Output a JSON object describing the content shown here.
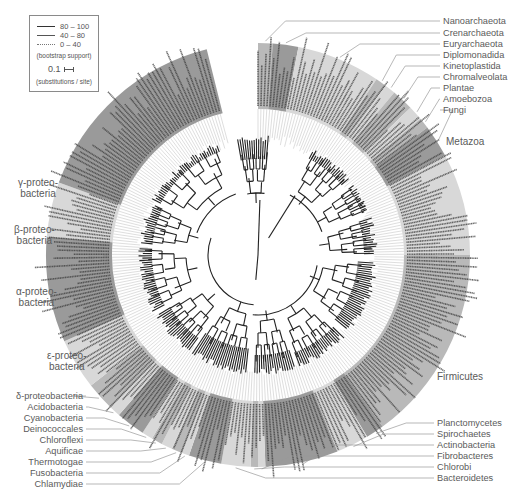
{
  "legend": {
    "support_entries": [
      {
        "style": "thick",
        "range": "80 – 100"
      },
      {
        "style": "medium",
        "range": "40 – 80"
      },
      {
        "style": "dotted",
        "range": "0 – 40"
      }
    ],
    "support_caption": "(bootstrap support)",
    "scale_value": "0.1",
    "scale_caption": "(substitutions / site)"
  },
  "colors": {
    "band_dark": "#9a9a9a",
    "band_mid": "#b9b9b9",
    "band_light": "#d8d8d8",
    "branch": "#222222",
    "leader_line": "#9a9a9a",
    "label_text": "#5a5a5a"
  },
  "labels_right_top": [
    {
      "text": "Nanoarchaeota",
      "x": 443,
      "y": 16
    },
    {
      "text": "Crenarchaeota",
      "x": 443,
      "y": 28
    },
    {
      "text": "Euryarchaeota",
      "x": 443,
      "y": 39
    },
    {
      "text": "Diplomonadida",
      "x": 443,
      "y": 50
    },
    {
      "text": "Kinetoplastida",
      "x": 443,
      "y": 61
    },
    {
      "text": "Chromalveolata",
      "x": 443,
      "y": 72
    },
    {
      "text": "Plantae",
      "x": 443,
      "y": 83
    },
    {
      "text": "Amoebozoa",
      "x": 443,
      "y": 94
    },
    {
      "text": "Fungi",
      "x": 443,
      "y": 105
    }
  ],
  "labels_right_mid": [
    {
      "text": "Metazoa",
      "x": 446,
      "y": 137
    },
    {
      "text": "Firmicutes",
      "x": 437,
      "y": 372
    }
  ],
  "labels_right_bottom": [
    {
      "text": "Planctomycetes",
      "x": 437,
      "y": 418
    },
    {
      "text": "Spirochaetes",
      "x": 437,
      "y": 429
    },
    {
      "text": "Actinobacteria",
      "x": 437,
      "y": 440
    },
    {
      "text": "Fibrobacteres",
      "x": 437,
      "y": 451
    },
    {
      "text": "Chlorobi",
      "x": 437,
      "y": 462
    },
    {
      "text": "Bacteroidetes",
      "x": 437,
      "y": 473
    }
  ],
  "labels_left_multi": [
    {
      "text": "γ-proteo-\nbacteria",
      "x": 18,
      "y": 177
    },
    {
      "text": "β-proteo-\nbacteria",
      "x": 14,
      "y": 224
    },
    {
      "text": "α-proteo-\nbacteria",
      "x": 16,
      "y": 286
    },
    {
      "text": "ε-proteo-\nbacteria",
      "x": 47,
      "y": 350
    }
  ],
  "labels_left_bottom": [
    {
      "text": "δ-proteobacteria",
      "right": 83,
      "y": 391
    },
    {
      "text": "Acidobacteria",
      "right": 83,
      "y": 402
    },
    {
      "text": "Cyanobacteria",
      "right": 83,
      "y": 413
    },
    {
      "text": "Deinococcales",
      "right": 83,
      "y": 424
    },
    {
      "text": "Chloroflexi",
      "right": 83,
      "y": 435
    },
    {
      "text": "Aquificae",
      "right": 83,
      "y": 446
    },
    {
      "text": "Thermotogae",
      "right": 83,
      "y": 457
    },
    {
      "text": "Fusobacteria",
      "right": 83,
      "y": 468
    },
    {
      "text": "Chlamydiae",
      "right": 83,
      "y": 479
    }
  ],
  "tree": {
    "center_x": 258,
    "center_y": 255,
    "inner_radius": 118,
    "outer_radius": 212,
    "gap_start_deg": -104,
    "gap_end_deg": -90,
    "clades": [
      {
        "name": "Nanoarchaeota",
        "start": -90,
        "end": -86,
        "shade": "mid"
      },
      {
        "name": "Crenarchaeota",
        "start": -86,
        "end": -79,
        "shade": "dark"
      },
      {
        "name": "Euryarchaeota",
        "start": -79,
        "end": -56,
        "shade": "light"
      },
      {
        "name": "Diplomonadida",
        "start": -56,
        "end": -53,
        "shade": "mid"
      },
      {
        "name": "Kinetoplastida",
        "start": -53,
        "end": -50,
        "shade": "light"
      },
      {
        "name": "Chromalveolata",
        "start": -50,
        "end": -44,
        "shade": "mid"
      },
      {
        "name": "Plantae",
        "start": -44,
        "end": -40,
        "shade": "light"
      },
      {
        "name": "Amoebozoa",
        "start": -40,
        "end": -37,
        "shade": "mid"
      },
      {
        "name": "Fungi",
        "start": -37,
        "end": -28,
        "shade": "dark"
      },
      {
        "name": "Metazoa",
        "start": -28,
        "end": 0,
        "shade": "light"
      },
      {
        "name": "Firmicutes",
        "start": 0,
        "end": 54,
        "shade": "mid"
      },
      {
        "name": "Planctomycetes",
        "start": 54,
        "end": 59,
        "shade": "dark"
      },
      {
        "name": "Spirochaetes",
        "start": 59,
        "end": 68,
        "shade": "light"
      },
      {
        "name": "Actinobacteria",
        "start": 68,
        "end": 88,
        "shade": "dark"
      },
      {
        "name": "Fibrobacteres",
        "start": 88,
        "end": 90,
        "shade": "light"
      },
      {
        "name": "Chlorobi",
        "start": 90,
        "end": 92,
        "shade": "mid"
      },
      {
        "name": "Bacteroidetes",
        "start": 92,
        "end": 100,
        "shade": "light"
      },
      {
        "name": "Chlamydiae",
        "start": 100,
        "end": 109,
        "shade": "dark"
      },
      {
        "name": "Fusobacteria",
        "start": 109,
        "end": 111,
        "shade": "light"
      },
      {
        "name": "Thermotogae",
        "start": 111,
        "end": 114,
        "shade": "mid"
      },
      {
        "name": "Aquificae",
        "start": 114,
        "end": 117,
        "shade": "light"
      },
      {
        "name": "Chloroflexi",
        "start": 117,
        "end": 120,
        "shade": "mid"
      },
      {
        "name": "Deinococcales",
        "start": 120,
        "end": 123,
        "shade": "light"
      },
      {
        "name": "Cyanobacteria",
        "start": 123,
        "end": 131,
        "shade": "dark"
      },
      {
        "name": "Acidobacteria",
        "start": 131,
        "end": 134,
        "shade": "light"
      },
      {
        "name": "δ-proteobacteria",
        "start": 134,
        "end": 142,
        "shade": "mid"
      },
      {
        "name": "ε-proteobacteria",
        "start": 142,
        "end": 156,
        "shade": "light"
      },
      {
        "name": "α-proteobacteria",
        "start": 156,
        "end": 185,
        "shade": "dark"
      },
      {
        "name": "β-proteobacteria",
        "start": 185,
        "end": 200,
        "shade": "light"
      },
      {
        "name": "γ-proteobacteria",
        "start": 200,
        "end": 256,
        "shade": "dark"
      }
    ]
  }
}
